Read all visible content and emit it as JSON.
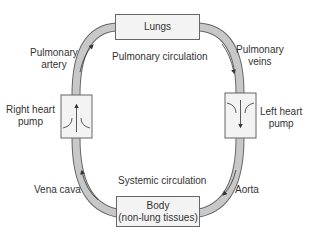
{
  "nodes": {
    "lungs": "Lungs",
    "body_line1": "Body",
    "body_line2": "(non-lung tissues)",
    "right_pump_line1": "Right heart",
    "right_pump_line2": "pump",
    "left_pump_line1": "Left heart",
    "left_pump_line2": "pump"
  },
  "vessels": {
    "pulmonary_artery_line1": "Pulmonary",
    "pulmonary_artery_line2": "artery",
    "pulmonary_veins_line1": "Pulmonary",
    "pulmonary_veins_line2": "veins",
    "vena_cava": "Vena cava",
    "aorta": "Aorta"
  },
  "circuits": {
    "pulmonary": "Pulmonary circulation",
    "systemic": "Systemic circulation"
  },
  "colors": {
    "vessel_fill": "#c8c8c8",
    "vessel_stroke": "#666666",
    "box_fill": "#f3f3f3",
    "text": "#333333"
  }
}
